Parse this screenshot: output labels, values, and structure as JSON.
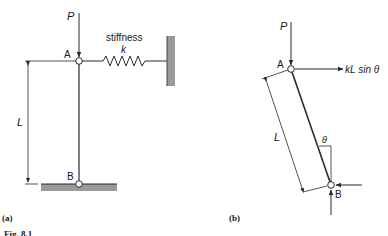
{
  "figure": {
    "caption_fragment": "Fig. 8.1",
    "panel_a": {
      "label": "(a)",
      "load_label": "P",
      "node_top": "A",
      "node_bottom": "B",
      "length_label": "L",
      "spring_label_line1": "stiffness",
      "spring_label_line2": "k"
    },
    "panel_b": {
      "label": "(b)",
      "load_label": "P",
      "node_top": "A",
      "node_bottom": "B",
      "length_label": "L",
      "force_label": "kL sin θ",
      "angle_label": "θ"
    },
    "colors": {
      "line": "#2a2a2a",
      "support_fill": "#9a9a9a"
    }
  }
}
